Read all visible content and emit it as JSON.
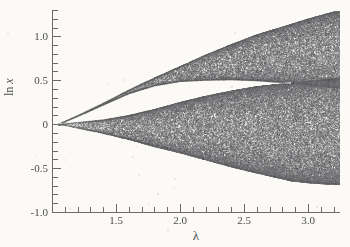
{
  "figure": {
    "background_color": "#fbfaf7",
    "ink_color": "#5a5a5a"
  },
  "axis_titles": {
    "y_prefix": "ln",
    "y_variable": "x",
    "x": "λ"
  },
  "chart_data": {
    "type": "scatter",
    "title": "",
    "subtitle": "",
    "xlabel": "λ",
    "ylabel": "ln x",
    "grid": false,
    "legend": null,
    "annotations": [],
    "xlim": [
      1.0,
      3.25
    ],
    "ylim": [
      -1.0,
      1.3
    ],
    "x_ticks_major": [
      1.5,
      2.0,
      2.5,
      3.0
    ],
    "x_ticks_major_labels": [
      "1.5",
      "2.0",
      "2.5",
      "3.0"
    ],
    "x_ticks_minor_step": 0.1,
    "y_ticks_major": [
      1.0,
      0.5,
      0,
      -0.5,
      -1.0
    ],
    "y_ticks_major_labels": [
      "1.0",
      "0.5",
      "0",
      "-0.5",
      "-1.0"
    ],
    "y_ticks_minor_step": 0.1,
    "features": {
      "onset_lambda": 1.05,
      "onset_ln_x": 0.0,
      "band_merge_lambda": 2.87,
      "band_merge_ln_x": 0.47,
      "upper_envelope_at_xmax": 1.28,
      "lower_envelope_at_xmax": -0.68,
      "dense_chaos_begins_lambda": 1.65
    },
    "series": [
      {
        "name": "upper chaotic band",
        "upper_envelope": {
          "x": [
            1.05,
            1.2,
            1.4,
            1.6,
            1.8,
            2.0,
            2.2,
            2.4,
            2.6,
            2.87,
            3.0,
            3.2
          ],
          "y": [
            0.0,
            0.1,
            0.24,
            0.39,
            0.53,
            0.66,
            0.79,
            0.91,
            1.02,
            1.14,
            1.2,
            1.28
          ]
        },
        "lower_envelope": {
          "x": [
            1.05,
            1.2,
            1.4,
            1.6,
            1.8,
            2.0,
            2.2,
            2.4,
            2.6,
            2.87,
            3.0,
            3.2
          ],
          "y": [
            0.0,
            0.09,
            0.22,
            0.35,
            0.44,
            0.49,
            0.505,
            0.51,
            0.5,
            0.47,
            0.45,
            0.42
          ]
        }
      },
      {
        "name": "lower chaotic band",
        "upper_envelope": {
          "x": [
            1.05,
            1.2,
            1.4,
            1.6,
            1.8,
            2.0,
            2.2,
            2.4,
            2.6,
            2.87,
            3.0,
            3.2
          ],
          "y": [
            0.0,
            0.02,
            0.05,
            0.1,
            0.17,
            0.25,
            0.32,
            0.38,
            0.43,
            0.47,
            0.49,
            0.52
          ]
        },
        "lower_envelope": {
          "x": [
            1.05,
            1.2,
            1.4,
            1.6,
            1.8,
            2.0,
            2.2,
            2.4,
            2.6,
            2.87,
            3.0,
            3.2
          ],
          "y": [
            0.0,
            -0.04,
            -0.1,
            -0.17,
            -0.25,
            -0.32,
            -0.4,
            -0.48,
            -0.55,
            -0.64,
            -0.66,
            -0.68
          ]
        }
      }
    ]
  }
}
